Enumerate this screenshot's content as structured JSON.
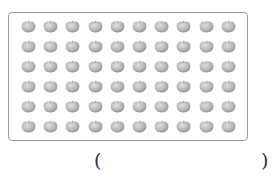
{
  "figure": {
    "grid": {
      "rows": 6,
      "columns": 10,
      "total": 60,
      "item": "apple-icon"
    },
    "colors": {
      "border": "#9a9a9a",
      "apple_light": "#e0e0e0",
      "apple_mid": "#b8b8b8",
      "apple_dark": "#8e8e8e"
    }
  },
  "answer_blank": {
    "open": "(",
    "close": ")",
    "value": ""
  }
}
